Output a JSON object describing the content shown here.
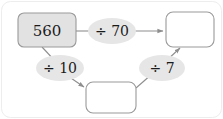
{
  "diagram": {
    "background_color": "#ffffff",
    "frame_color": "#ededed",
    "nodes": [
      {
        "id": "start",
        "label": "560",
        "shape": "rounded-rect",
        "fill": "#e2e2e2",
        "stroke": "#9a9a9a",
        "filled": true
      },
      {
        "id": "top_right",
        "label": "",
        "shape": "rounded-rect",
        "fill": "#ffffff",
        "stroke": "#9a9a9a",
        "filled": false
      },
      {
        "id": "bottom",
        "label": "",
        "shape": "rounded-rect",
        "fill": "#ffffff",
        "stroke": "#9a9a9a",
        "filled": false
      }
    ],
    "operations": [
      {
        "id": "op_div70",
        "label": "÷ 70",
        "operator": "÷",
        "operand": "70",
        "shape": "ellipse",
        "fill": "#e6e6e6"
      },
      {
        "id": "op_div10",
        "label": "÷ 10",
        "operator": "÷",
        "operand": "10",
        "shape": "ellipse",
        "fill": "#e6e6e6"
      },
      {
        "id": "op_div7",
        "label": "÷ 7",
        "operator": "÷",
        "operand": "7",
        "shape": "ellipse",
        "fill": "#e6e6e6"
      }
    ],
    "edges": [
      {
        "id": "e1",
        "from": "start",
        "to": "op_div70",
        "arrow": false
      },
      {
        "id": "e2",
        "from": "op_div70",
        "to": "top_right",
        "arrow": true
      },
      {
        "id": "e3",
        "from": "start",
        "to": "op_div10",
        "arrow": false
      },
      {
        "id": "e4",
        "from": "op_div10",
        "to": "bottom",
        "arrow": true
      },
      {
        "id": "e5",
        "from": "bottom",
        "to": "op_div7",
        "arrow": false
      },
      {
        "id": "e6",
        "from": "op_div7",
        "to": "top_right",
        "arrow": true
      }
    ],
    "edge_color": "#8e8e8e"
  }
}
